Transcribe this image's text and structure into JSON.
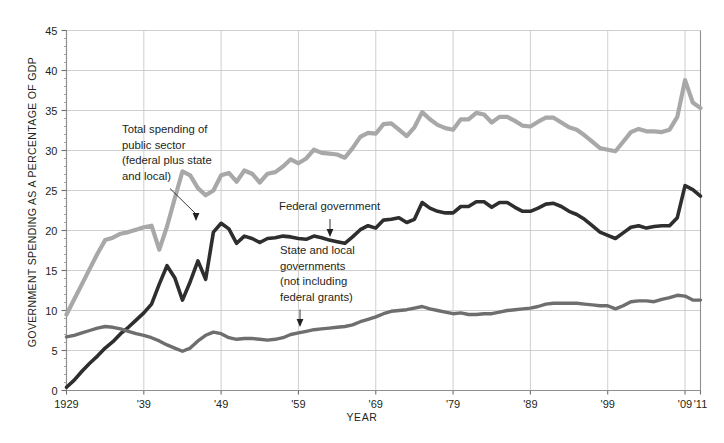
{
  "chart_data": {
    "type": "line",
    "title": "",
    "xlabel": "YEAR",
    "ylabel": "GOVERNMENT SPENDING AS A PERCENTAGE OF GDP",
    "xlim": [
      1929,
      2011
    ],
    "ylim": [
      0,
      45
    ],
    "ytick_step": 5,
    "grid": true,
    "legend": "annotations-inline",
    "xticks": [
      1929,
      1939,
      1949,
      1959,
      1969,
      1979,
      1989,
      1999,
      2009,
      2011
    ],
    "xtick_labels": [
      "1929",
      "'39",
      "'49",
      "'59",
      "'69",
      "'79",
      "'89",
      "'99",
      "'09",
      "'11"
    ],
    "yticks": [
      0,
      5,
      10,
      15,
      20,
      25,
      30,
      35,
      40,
      45
    ],
    "ytick_labels": [
      "0",
      "5",
      "10",
      "15",
      "20",
      "25",
      "30",
      "35",
      "40",
      "45"
    ],
    "x": [
      1929,
      1930,
      1931,
      1932,
      1933,
      1934,
      1935,
      1936,
      1937,
      1938,
      1939,
      1940,
      1941,
      1942,
      1943,
      1944,
      1945,
      1946,
      1947,
      1948,
      1949,
      1950,
      1951,
      1952,
      1953,
      1954,
      1955,
      1956,
      1957,
      1958,
      1959,
      1960,
      1961,
      1962,
      1963,
      1964,
      1965,
      1966,
      1967,
      1968,
      1969,
      1970,
      1971,
      1972,
      1973,
      1974,
      1975,
      1976,
      1977,
      1978,
      1979,
      1980,
      1981,
      1982,
      1983,
      1984,
      1985,
      1986,
      1987,
      1988,
      1989,
      1990,
      1991,
      1992,
      1993,
      1994,
      1995,
      1996,
      1997,
      1998,
      1999,
      2000,
      2001,
      2002,
      2003,
      2004,
      2005,
      2006,
      2007,
      2008,
      2009,
      2010,
      2011
    ],
    "series": [
      {
        "name": "Total spending of public sector (federal plus state and local)",
        "color": "#a8a8a8",
        "values": [
          9.5,
          11.4,
          13.3,
          15.2,
          17.1,
          18.8,
          19.1,
          19.6,
          19.8,
          20.1,
          20.4,
          20.6,
          17.6,
          20.5,
          24.0,
          27.4,
          26.9,
          25.3,
          24.4,
          25.0,
          26.9,
          27.2,
          26.1,
          27.5,
          27.1,
          26.0,
          27.1,
          27.3,
          28.0,
          28.9,
          28.4,
          29.0,
          30.1,
          29.7,
          29.6,
          29.5,
          29.1,
          30.3,
          31.7,
          32.2,
          32.1,
          33.3,
          33.4,
          32.6,
          31.8,
          32.9,
          34.8,
          33.9,
          33.2,
          32.8,
          32.6,
          33.9,
          33.9,
          34.7,
          34.5,
          33.5,
          34.2,
          34.2,
          33.7,
          33.1,
          33.0,
          33.6,
          34.1,
          34.1,
          33.5,
          32.9,
          32.6,
          31.9,
          31.1,
          30.3,
          30.1,
          29.9,
          31.1,
          32.3,
          32.7,
          32.4,
          32.4,
          32.3,
          32.6,
          34.2,
          38.8,
          36.0,
          35.3
        ],
        "label_note": "thick light-gray upper line"
      },
      {
        "name": "Federal government",
        "color": "#2e2e2e",
        "values": [
          0.4,
          1.3,
          2.4,
          3.4,
          4.3,
          5.3,
          6.1,
          7.1,
          7.9,
          8.8,
          9.7,
          10.8,
          13.3,
          15.6,
          14.1,
          11.3,
          13.6,
          16.2,
          13.9,
          19.8,
          20.9,
          20.2,
          18.4,
          19.3,
          19.0,
          18.5,
          19.0,
          19.1,
          19.3,
          19.2,
          19.0,
          18.9,
          19.3,
          19.1,
          18.8,
          18.6,
          18.4,
          19.2,
          20.1,
          20.6,
          20.3,
          21.3,
          21.4,
          21.6,
          21.0,
          21.4,
          23.5,
          22.8,
          22.4,
          22.2,
          22.2,
          23.0,
          23.0,
          23.6,
          23.6,
          22.9,
          23.5,
          23.5,
          22.9,
          22.4,
          22.4,
          22.8,
          23.3,
          23.4,
          23.0,
          22.4,
          22.0,
          21.4,
          20.6,
          19.8,
          19.4,
          19.0,
          19.7,
          20.4,
          20.6,
          20.3,
          20.5,
          20.6,
          20.6,
          21.6,
          25.6,
          25.1,
          24.3
        ],
        "label_note": "thick dark line"
      },
      {
        "name": "State and local governments (not including federal grants)",
        "color": "#6e6e6e",
        "values": [
          6.7,
          6.9,
          7.2,
          7.5,
          7.8,
          8.0,
          7.9,
          7.7,
          7.4,
          7.1,
          6.9,
          6.6,
          6.2,
          5.7,
          5.3,
          4.9,
          5.3,
          6.2,
          6.9,
          7.3,
          7.1,
          6.6,
          6.4,
          6.5,
          6.5,
          6.4,
          6.3,
          6.4,
          6.6,
          7.0,
          7.2,
          7.4,
          7.6,
          7.7,
          7.8,
          7.9,
          8.0,
          8.2,
          8.6,
          8.9,
          9.2,
          9.6,
          9.9,
          10.0,
          10.1,
          10.3,
          10.5,
          10.2,
          10.0,
          9.8,
          9.6,
          9.7,
          9.5,
          9.5,
          9.6,
          9.6,
          9.8,
          10.0,
          10.1,
          10.2,
          10.3,
          10.5,
          10.8,
          10.9,
          10.9,
          10.9,
          10.9,
          10.8,
          10.7,
          10.6,
          10.6,
          10.2,
          10.6,
          11.1,
          11.2,
          11.2,
          11.1,
          11.4,
          11.6,
          11.9,
          11.8,
          11.3,
          11.3
        ],
        "label_note": "medium-gray lower line"
      }
    ],
    "annotations": [
      {
        "name": "total-spending-annotation",
        "lines": [
          "Total spending of",
          "public sector",
          "(federal plus state",
          "and local)"
        ],
        "points_to_series": "Total spending of public sector (federal plus state and local)",
        "points_to_year": 1942
      },
      {
        "name": "federal-government-annotation",
        "lines": [
          "Federal government"
        ],
        "points_to_series": "Federal government",
        "points_to_year": 1962
      },
      {
        "name": "state-local-annotation",
        "lines": [
          "State and local",
          "governments",
          "(not including",
          "federal grants)"
        ],
        "points_to_series": "State and local governments (not including federal grants)",
        "points_to_year": 1960
      }
    ]
  },
  "colors": {
    "total": "#a8a8a8",
    "federal": "#2e2e2e",
    "state_local": "#6e6e6e",
    "grid": "#c9c9c9",
    "frame": "#8f8f8f",
    "text": "#231f20",
    "background": "#ffffff"
  }
}
